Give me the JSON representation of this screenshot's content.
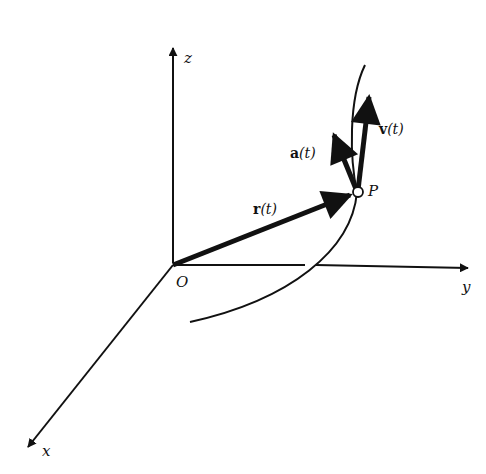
{
  "diagram": {
    "axes": {
      "x": {
        "label": "x"
      },
      "y": {
        "label": "y"
      },
      "z": {
        "label": "z"
      }
    },
    "origin": {
      "label": "O"
    },
    "point": {
      "label": "P"
    },
    "vectors": {
      "position": {
        "symbol": "r",
        "arg": "(t)"
      },
      "velocity": {
        "symbol": "v",
        "arg": "(t)"
      },
      "acceleration": {
        "symbol": "a",
        "arg": "(t)"
      }
    },
    "colors": {
      "ink": "#111111",
      "background": "#ffffff"
    }
  }
}
